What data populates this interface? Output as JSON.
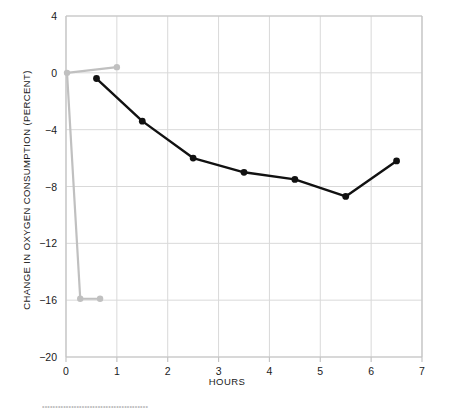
{
  "chart_data": {
    "type": "line",
    "title": "",
    "xlabel": "HOURS",
    "ylabel": "CHANGE IN OXYGEN CONSUMPTION (PERCENT)",
    "xlim": [
      0,
      7
    ],
    "ylim": [
      -20,
      4
    ],
    "xticks": [
      "0",
      "1",
      "2",
      "3",
      "4",
      "5",
      "6",
      "7"
    ],
    "xtick_values": [
      0,
      1,
      2,
      3,
      4,
      5,
      6,
      7
    ],
    "yticks": [
      "4",
      "0",
      "−4",
      "−8",
      "−12",
      "−16",
      "−20"
    ],
    "ytick_values": [
      4,
      0,
      -4,
      -8,
      -12,
      -16,
      -20
    ],
    "grid": true,
    "legend": "none",
    "series": [
      {
        "name": "black-series",
        "color": "#111111",
        "marker": "circle",
        "points": [
          {
            "x": 0.6,
            "y": -0.4
          },
          {
            "x": 1.5,
            "y": -3.4
          },
          {
            "x": 2.5,
            "y": -6.0
          },
          {
            "x": 3.5,
            "y": -7.0
          },
          {
            "x": 4.5,
            "y": -7.5
          },
          {
            "x": 5.5,
            "y": -8.7
          },
          {
            "x": 6.5,
            "y": -6.2
          }
        ]
      },
      {
        "name": "gray-series",
        "color": "#c0c0c0",
        "marker": "circle",
        "points": [
          {
            "x": 0.02,
            "y": 0.0
          },
          {
            "x": 1.0,
            "y": 0.4
          },
          {
            "x": 0.28,
            "y": -15.9
          },
          {
            "x": 0.67,
            "y": -15.9
          }
        ],
        "path_order": [
          1,
          0,
          2,
          3
        ]
      }
    ]
  },
  "footnote": {
    "text": "••••••••••••••••••••••••••••••••••••••••"
  },
  "colors": {
    "grid": "#d9d9d9",
    "frame": "#c4c4c4",
    "black_series": "#111111",
    "gray_series": "#c0c0c0",
    "text": "#1a1a1a",
    "background": "#ffffff"
  }
}
